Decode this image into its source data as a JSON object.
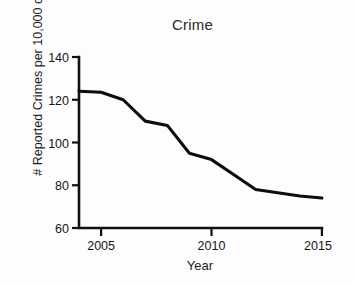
{
  "chart_data": {
    "type": "line",
    "title": "Crime",
    "xlabel": "Year",
    "ylabel": "# Reported Crimes per 10,000 citizens",
    "x": [
      2004,
      2005,
      2006,
      2007,
      2008,
      2009,
      2010,
      2011,
      2012,
      2013,
      2014,
      2015
    ],
    "values": [
      124,
      123.5,
      120,
      110,
      108,
      95,
      92,
      85,
      78,
      76.5,
      75,
      74
    ],
    "series": [
      {
        "name": "Reported Crimes",
        "values": [
          124,
          123.5,
          120,
          110,
          108,
          95,
          92,
          85,
          78,
          76.5,
          75,
          74
        ]
      }
    ],
    "xlim": [
      2004,
      2015
    ],
    "ylim": [
      60,
      140
    ],
    "ytick_labels": [
      "60",
      "80",
      "100",
      "120",
      "140"
    ],
    "ytick_values": [
      60,
      80,
      100,
      120,
      140
    ],
    "xtick_labels": [
      "2005",
      "2010",
      "2015"
    ],
    "xtick_values": [
      2005,
      2010,
      2015
    ],
    "grid": false,
    "legend": false,
    "line_color": "#0d0d0d",
    "background_color": "#ffffff"
  }
}
